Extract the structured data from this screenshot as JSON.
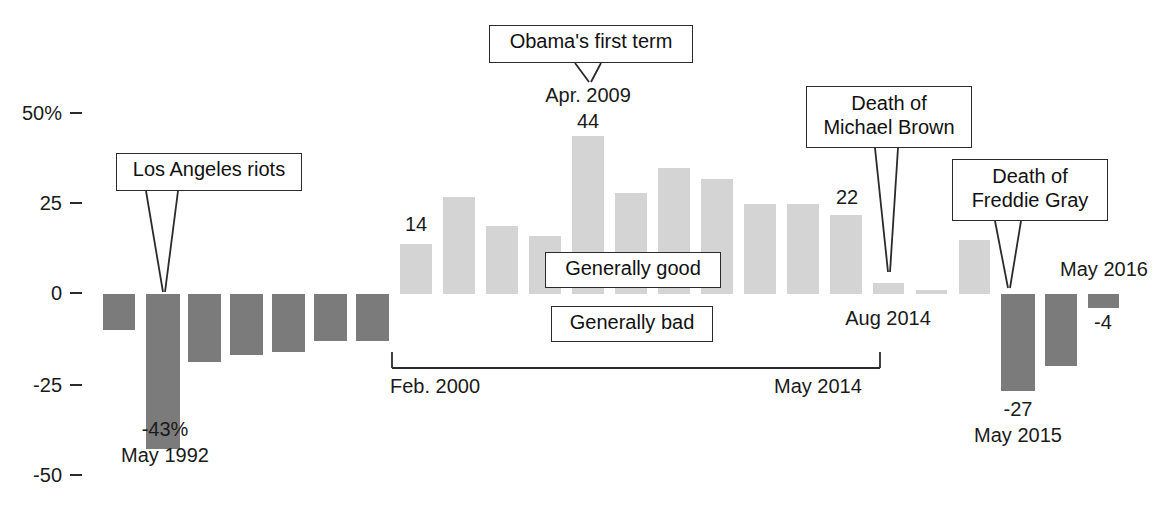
{
  "chart_data": {
    "type": "bar",
    "title": "",
    "subtitle": "",
    "xlabel": "",
    "ylabel": "",
    "ylim": [
      -50,
      50
    ],
    "grid": false,
    "legend": "none",
    "y_ticks": [
      "50%",
      "25",
      "0",
      "-25",
      "-50"
    ],
    "y_tick_values": [
      50,
      25,
      0,
      -25,
      -50
    ],
    "note": "Net rating: percent saying race relations generally good minus generally bad",
    "series": [
      {
        "name": "Net race-relations rating",
        "color_negative": "#7b7b7b",
        "color_positive": "#d4d4d4",
        "points": [
          {
            "label": "",
            "value": -10,
            "group": "early",
            "color": "dark"
          },
          {
            "label": "May 1992",
            "value": -43,
            "group": "early",
            "color": "dark",
            "data_label": "-43%"
          },
          {
            "label": "",
            "value": -19,
            "group": "early",
            "color": "dark"
          },
          {
            "label": "",
            "value": -17,
            "group": "early",
            "color": "dark"
          },
          {
            "label": "",
            "value": -16,
            "group": "early",
            "color": "dark"
          },
          {
            "label": "",
            "value": -13,
            "group": "early",
            "color": "dark"
          },
          {
            "label": "",
            "value": -13,
            "group": "early",
            "color": "dark"
          },
          {
            "label": "Feb. 2000",
            "value": 14,
            "group": "middle",
            "color": "light",
            "data_label": "14"
          },
          {
            "label": "",
            "value": 27,
            "group": "middle",
            "color": "light"
          },
          {
            "label": "",
            "value": 19,
            "group": "middle",
            "color": "light"
          },
          {
            "label": "",
            "value": 16,
            "group": "middle",
            "color": "light"
          },
          {
            "label": "Apr. 2009",
            "value": 44,
            "group": "middle",
            "color": "light",
            "data_label": "44"
          },
          {
            "label": "",
            "value": 28,
            "group": "middle",
            "color": "light"
          },
          {
            "label": "",
            "value": 35,
            "group": "middle",
            "color": "light"
          },
          {
            "label": "",
            "value": 32,
            "group": "middle",
            "color": "light"
          },
          {
            "label": "",
            "value": 25,
            "group": "middle",
            "color": "light"
          },
          {
            "label": "",
            "value": 25,
            "group": "middle",
            "color": "light"
          },
          {
            "label": "May 2014",
            "value": 22,
            "group": "middle",
            "color": "light",
            "data_label": "22"
          },
          {
            "label": "Aug 2014",
            "value": 3,
            "group": "late",
            "color": "light"
          },
          {
            "label": "",
            "value": 1,
            "group": "late",
            "color": "light"
          },
          {
            "label": "",
            "value": 15,
            "group": "late",
            "color": "light"
          },
          {
            "label": "May 2015",
            "value": -27,
            "group": "late",
            "color": "dark",
            "data_label": "-27"
          },
          {
            "label": "",
            "value": -20,
            "group": "late",
            "color": "dark"
          },
          {
            "label": "May 2016",
            "value": -4,
            "group": "late",
            "color": "dark",
            "data_label": "-4"
          }
        ]
      }
    ],
    "annotations": [
      {
        "name": "los-angeles-riots",
        "text": "Los Angeles riots",
        "points_to": "May 1992"
      },
      {
        "name": "obamas-first-term",
        "text": "Obama's first term",
        "points_to": "Apr. 2009"
      },
      {
        "name": "death-of-michael-brown",
        "text": "Death of\nMichael Brown",
        "points_to": "Aug 2014"
      },
      {
        "name": "death-of-freddie-gray",
        "text": "Death of\nFreddie Gray",
        "points_to": "May 2015"
      }
    ],
    "inline_tags": [
      "Generally good",
      "Generally bad"
    ],
    "range_bracket": {
      "start": "Feb. 2000",
      "end": "May 2014"
    }
  },
  "axis": {
    "tick_50": "50%",
    "tick_25": "25",
    "tick_0": "0",
    "tick_m25": "-25",
    "tick_m50": "-50"
  },
  "callouts": {
    "la_riots": "Los Angeles riots",
    "obama": "Obama's first term",
    "brown_line1": "Death of",
    "brown_line2": "Michael Brown",
    "gray_line1": "Death of",
    "gray_line2": "Freddie Gray"
  },
  "tags": {
    "good": "Generally good",
    "bad": "Generally bad"
  },
  "labels": {
    "may_1992_value": "-43%",
    "may_1992_date": "May 1992",
    "apr_2009_date": "Apr. 2009",
    "apr_2009_value": "44",
    "feb_2000_value": "14",
    "may_2014_value": "22",
    "aug_2014_date": "Aug 2014",
    "may_2015_value": "-27",
    "may_2015_date": "May 2015",
    "may_2016_date": "May 2016",
    "may_2016_value": "-4",
    "range_start": "Feb. 2000",
    "range_end": "May 2014"
  },
  "colors": {
    "bar_dark": "#7b7b7b",
    "bar_light": "#d4d4d4",
    "ink": "#1a1a1a"
  }
}
